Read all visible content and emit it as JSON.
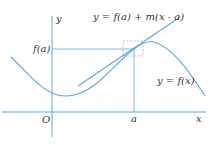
{
  "diagram": {
    "type": "tangent-line-illustration",
    "labels": {
      "y_axis": "y",
      "x_axis": "x",
      "origin": "O",
      "a_tick": "a",
      "fa_tick": "f(a)",
      "tangent_eq": "y = f(a) + m(x - a)",
      "curve_eq": "y = f(x)"
    },
    "colors": {
      "line": "#5aa9dc",
      "dashed_box": "#9aa6b2",
      "text": "#333333"
    }
  }
}
